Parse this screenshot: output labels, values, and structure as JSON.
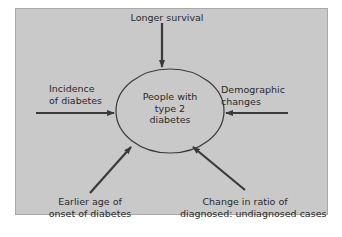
{
  "diagram": {
    "center": {
      "lines": [
        "People with",
        "type 2",
        "diabetes"
      ]
    },
    "factors": [
      {
        "id": "top",
        "lines": [
          "Longer survival"
        ]
      },
      {
        "id": "left",
        "lines": [
          "Incidence",
          "of diabetes"
        ]
      },
      {
        "id": "right",
        "lines": [
          "Demographic",
          "changes"
        ]
      },
      {
        "id": "bottom-left",
        "lines": [
          "Earlier age of",
          "onset of diabetes"
        ]
      },
      {
        "id": "bottom-right",
        "lines": [
          "Change in ratio of",
          "diagnosed: undiagnosed cases"
        ]
      }
    ],
    "colors": {
      "panel": "#c9c9c9",
      "stroke": "#3a3a3a",
      "text": "#2a2a2a"
    }
  }
}
